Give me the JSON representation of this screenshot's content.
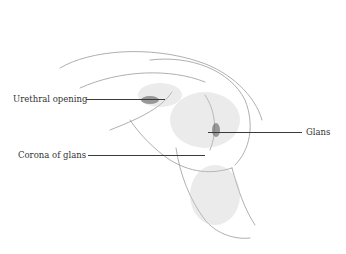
{
  "figure": {
    "labels": [
      {
        "text": "Urethral opening",
        "x": 13,
        "y": 94,
        "line": {
          "x1": 86,
          "x2": 165,
          "y": 99
        }
      },
      {
        "text": "Glans",
        "x": 306,
        "y": 127,
        "line": {
          "x1": 208,
          "x2": 302,
          "y": 132
        }
      },
      {
        "text": "Corona of glans",
        "x": 18,
        "y": 150,
        "line": {
          "x1": 88,
          "x2": 205,
          "y": 155
        }
      }
    ]
  }
}
